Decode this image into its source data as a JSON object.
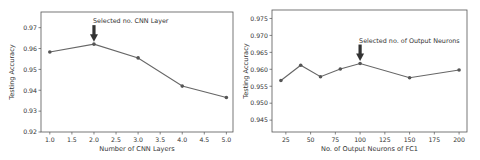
{
  "chart_data": [
    {
      "type": "line",
      "title": "",
      "xlabel": "Number of CNN Layers",
      "ylabel": "Testing Accuracy",
      "x": [
        1.0,
        2.0,
        3.0,
        4.0,
        5.0
      ],
      "values": [
        0.9583,
        0.9621,
        0.9555,
        0.942,
        0.9365
      ],
      "xticks": [
        "1.0",
        "1.5",
        "2.0",
        "2.5",
        "3.0",
        "3.5",
        "4.0",
        "4.5",
        "5.0"
      ],
      "yticks": [
        "0.92",
        "0.93",
        "0.94",
        "0.95",
        "0.96",
        "0.97"
      ],
      "xlim": [
        0.8,
        5.15
      ],
      "ylim": [
        0.92,
        0.9775
      ],
      "grid": false,
      "annotation": {
        "text": "Selected no. CNN Layer",
        "x": 2.0,
        "arrow": "down"
      }
    },
    {
      "type": "line",
      "title": "",
      "xlabel": "No. of Output Neurons of FC1",
      "ylabel": "Testing Accuracy",
      "x": [
        20,
        40,
        60,
        80,
        100,
        150,
        200
      ],
      "values": [
        0.9567,
        0.9612,
        0.9578,
        0.9601,
        0.9617,
        0.9575,
        0.9598
      ],
      "xticks": [
        "25",
        "50",
        "75",
        "100",
        "125",
        "150",
        "175",
        "200"
      ],
      "yticks": [
        "0.945",
        "0.950",
        "0.955",
        "0.960",
        "0.965",
        "0.970",
        "0.975"
      ],
      "xlim": [
        11,
        208
      ],
      "ylim": [
        0.9415,
        0.9775
      ],
      "grid": false,
      "annotation": {
        "text": "Selected no. of Output Neurons",
        "x": 100,
        "arrow": "down"
      }
    }
  ]
}
